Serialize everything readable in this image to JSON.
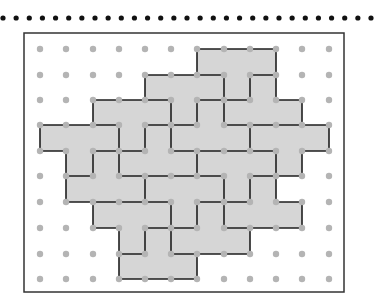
{
  "title_rule": {
    "y": 18,
    "x_start": 3,
    "x_end": 371,
    "count": 29,
    "radius": 2.6,
    "color": "#111111"
  },
  "frame": {
    "x": 24,
    "y": 33,
    "width": 320,
    "height": 259,
    "stroke": "#333333",
    "stroke_width": 1.5
  },
  "grid": {
    "columns_x": [
      40,
      66,
      93,
      119,
      145,
      171,
      197,
      224,
      250,
      276,
      302,
      329
    ],
    "rows_y": [
      49,
      75,
      100,
      125,
      151,
      176,
      202,
      228,
      254,
      279
    ],
    "dot_radius": 3.2,
    "dot_color": "#b4b4b4"
  },
  "shape": {
    "fill": "#d6d6d6",
    "line_color": "#1e1e1e",
    "line_width": 1.6,
    "shaded_rows": [
      {
        "row": 0,
        "col_start": 6,
        "col_end": 9
      },
      {
        "row": 1,
        "col_start": 4,
        "col_end": 9
      },
      {
        "row": 2,
        "col_start": 2,
        "col_end": 10
      },
      {
        "row": 3,
        "col_start": 0,
        "col_end": 11
      },
      {
        "row": 4,
        "col_start": 1,
        "col_end": 10
      },
      {
        "row": 5,
        "col_start": 1,
        "col_end": 9
      },
      {
        "row": 6,
        "col_start": 2,
        "col_end": 10
      },
      {
        "row": 7,
        "col_start": 3,
        "col_end": 8
      },
      {
        "row": 8,
        "col_start": 3,
        "col_end": 6
      }
    ],
    "horizontal_edges": [
      [
        0,
        6,
        9
      ],
      [
        1,
        4,
        7
      ],
      [
        1,
        8,
        9
      ],
      [
        2,
        2,
        5
      ],
      [
        2,
        6,
        8
      ],
      [
        2,
        9,
        10
      ],
      [
        3,
        0,
        3
      ],
      [
        3,
        4,
        6
      ],
      [
        3,
        7,
        11
      ],
      [
        4,
        0,
        1
      ],
      [
        4,
        2,
        4
      ],
      [
        4,
        5,
        9
      ],
      [
        4,
        10,
        11
      ],
      [
        5,
        1,
        2
      ],
      [
        5,
        3,
        7
      ],
      [
        5,
        8,
        10
      ],
      [
        6,
        1,
        5
      ],
      [
        6,
        6,
        8
      ],
      [
        6,
        9,
        10
      ],
      [
        7,
        2,
        3
      ],
      [
        7,
        4,
        6
      ],
      [
        7,
        7,
        10
      ],
      [
        8,
        3,
        4
      ],
      [
        8,
        5,
        8
      ],
      [
        9,
        3,
        6
      ]
    ],
    "vertical_edges": [
      [
        0,
        3,
        4
      ],
      [
        1,
        4,
        6
      ],
      [
        2,
        2,
        3
      ],
      [
        2,
        4,
        5
      ],
      [
        2,
        6,
        7
      ],
      [
        3,
        3,
        5
      ],
      [
        3,
        7,
        9
      ],
      [
        4,
        1,
        2
      ],
      [
        4,
        3,
        4
      ],
      [
        4,
        5,
        6
      ],
      [
        4,
        7,
        8
      ],
      [
        5,
        2,
        4
      ],
      [
        5,
        6,
        8
      ],
      [
        6,
        0,
        1
      ],
      [
        6,
        2,
        3
      ],
      [
        6,
        4,
        5
      ],
      [
        6,
        6,
        7
      ],
      [
        6,
        8,
        9
      ],
      [
        7,
        1,
        3
      ],
      [
        7,
        5,
        7
      ],
      [
        8,
        1,
        2
      ],
      [
        8,
        3,
        4
      ],
      [
        8,
        5,
        6
      ],
      [
        8,
        7,
        8
      ],
      [
        9,
        0,
        2
      ],
      [
        9,
        4,
        6
      ],
      [
        10,
        2,
        3
      ],
      [
        10,
        4,
        5
      ],
      [
        10,
        6,
        7
      ],
      [
        11,
        3,
        4
      ]
    ]
  }
}
